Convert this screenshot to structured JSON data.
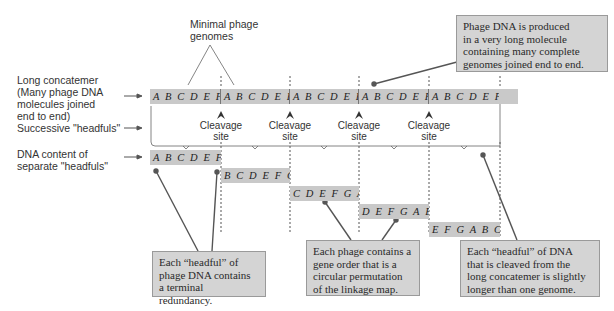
{
  "left_labels": {
    "concatemer": "Long concatemer\n(Many phage DNA\nmolecules joined\nend to end)",
    "headfuls": "Successive \"headfuls\"",
    "content": "DNA content of\nseparate \"headfuls\""
  },
  "top_label": "Minimal phage\ngenomes",
  "concatemer_sequence": "ABCDEFG ABCDEFG ABCDEFG ABCDEFG ABCDEFG ABCDEFG",
  "concatemer_units": [
    "A B C D E F G",
    "A B C D E F G",
    "A B C D E F G",
    "A B C D E F G",
    "A B C D E F G",
    "A B C D E F G"
  ],
  "cleavage_label": "Cleavage\nsite",
  "headful_segments": [
    "A B C D E F G A",
    "B C D E F G A B",
    "C D E F G A B C",
    "D E F G A B C D",
    "E F G A B C D E"
  ],
  "callouts": {
    "top_right": "Phage DNA is produced\nin a very long molecule\ncontaining many complete\ngenomes joined end to end.",
    "terminal_redundancy": "Each “headful” of\nphage DNA contains\na terminal redundancy.",
    "circular_permutation": "Each phage contains a\ngene order that is a\ncircular permutation\nof the linkage map.",
    "slightly_longer": "Each “headful” of DNA\nthat is cleaved from the\nlong concatemer is slightly\nlonger than one genome."
  },
  "colors": {
    "sequence_fill": "#c9c9c9",
    "callout_fill": "#d4d4d4",
    "callout_border": "#9a9a9a",
    "line": "#555555"
  }
}
